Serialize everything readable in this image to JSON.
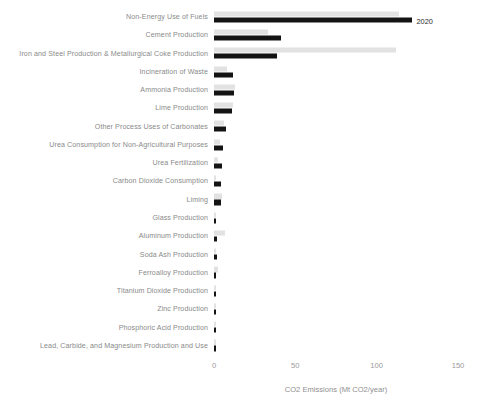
{
  "chart_data": {
    "type": "bar",
    "orientation": "horizontal",
    "title": "",
    "xlabel": "CO2 Emissions (Mt CO2/year)",
    "ylabel": "",
    "xlim": [
      0,
      150
    ],
    "xticks": [
      0,
      50,
      100,
      150
    ],
    "xtick_labels": [
      "0",
      "50",
      "100",
      "150"
    ],
    "grid": false,
    "legend_position": "inline-annotation",
    "annotations": [
      {
        "text": "2020",
        "attached_to": "Non-Energy Use of Fuels",
        "series": "2020"
      }
    ],
    "colors": {
      "prev": "#e2e2e2",
      "curr": "#141414",
      "text": "#8a8a8a",
      "background": "#ffffff"
    },
    "categories": [
      "Non-Energy Use of Fuels",
      "Cement Production",
      "Iron and Steel Production & Metallurgical Coke Production",
      "Incineration of Waste",
      "Ammonia Production",
      "Lime Production",
      "Other Process Uses of Carbonates",
      "Urea Consumption for Non-Agricultural Purposes",
      "Urea Fertilization",
      "Carbon Dioxide Consumption",
      "Liming",
      "Glass Production",
      "Aluminum Production",
      "Soda Ash Production",
      "Ferroalloy Production",
      "Titanium Dioxide Production",
      "Zinc Production",
      "Phosphoric Acid Production",
      "Lead, Carbide, and Magnesium Production and Use"
    ],
    "series": [
      {
        "name": "1990",
        "color": "#e2e2e2",
        "values": [
          114.0,
          33.3,
          112.0,
          8.0,
          13.0,
          11.7,
          6.3,
          3.8,
          2.4,
          1.5,
          4.7,
          1.5,
          6.8,
          1.4,
          2.2,
          1.2,
          0.6,
          1.5,
          0.9
        ]
      },
      {
        "name": "2020",
        "color": "#141414",
        "values": [
          122.0,
          41.0,
          39.0,
          11.5,
          12.3,
          11.3,
          7.5,
          5.4,
          5.0,
          4.6,
          4.0,
          1.5,
          1.7,
          1.8,
          1.4,
          1.5,
          1.1,
          1.0,
          0.7
        ]
      }
    ]
  },
  "axis": {
    "x_title": "CO2 Emissions (Mt CO2/year)",
    "tick_labels": [
      "0",
      "50",
      "100",
      "150"
    ]
  }
}
